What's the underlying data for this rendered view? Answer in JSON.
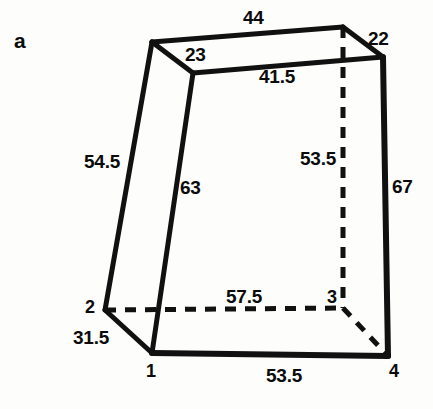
{
  "figure": {
    "panel_letter": "a",
    "description_type": "technical-line-drawing",
    "ink_color": "#111111",
    "background_color": "#fdfdfb",
    "vertex_labels": [
      {
        "id": "v1",
        "text": "1",
        "x": 146,
        "y": 362
      },
      {
        "id": "v2",
        "text": "2",
        "x": 85,
        "y": 298
      },
      {
        "id": "v3",
        "text": "3",
        "x": 327,
        "y": 288
      },
      {
        "id": "v4",
        "text": "4",
        "x": 389,
        "y": 362
      }
    ],
    "dimension_labels": [
      {
        "id": "top-back",
        "text": "44",
        "x": 243,
        "y": 8
      },
      {
        "id": "top-left-short",
        "text": "23",
        "x": 185,
        "y": 45
      },
      {
        "id": "top-right-short",
        "text": "22",
        "x": 368,
        "y": 29
      },
      {
        "id": "top-front",
        "text": "41.5",
        "x": 259,
        "y": 67
      },
      {
        "id": "left-back-edge",
        "text": "54.5",
        "x": 84,
        "y": 152
      },
      {
        "id": "left-front-edge",
        "text": "63",
        "x": 180,
        "y": 178
      },
      {
        "id": "back-right-edge",
        "text": "53.5",
        "x": 300,
        "y": 149
      },
      {
        "id": "right-edge",
        "text": "67",
        "x": 392,
        "y": 177
      },
      {
        "id": "bottom-back",
        "text": "57.5",
        "x": 226,
        "y": 287
      },
      {
        "id": "bottom-left",
        "text": "31.5",
        "x": 73,
        "y": 328
      },
      {
        "id": "bottom-front",
        "text": "53.5",
        "x": 266,
        "y": 366
      }
    ],
    "geometry": {
      "solid_edges": [
        {
          "name": "edge-top-back",
          "x1": 152,
          "y1": 42,
          "x2": 343,
          "y2": 27,
          "w": 5
        },
        {
          "name": "edge-top-left-short",
          "x1": 152,
          "y1": 42,
          "x2": 193,
          "y2": 73,
          "w": 5
        },
        {
          "name": "edge-top-front",
          "x1": 193,
          "y1": 73,
          "x2": 383,
          "y2": 57,
          "w": 5
        },
        {
          "name": "edge-top-right-short",
          "x1": 343,
          "y1": 27,
          "x2": 383,
          "y2": 57,
          "w": 5
        },
        {
          "name": "edge-left-back",
          "x1": 152,
          "y1": 42,
          "x2": 105,
          "y2": 310,
          "w": 5
        },
        {
          "name": "edge-left-front",
          "x1": 193,
          "y1": 73,
          "x2": 152,
          "y2": 353,
          "w": 5
        },
        {
          "name": "edge-right-front",
          "x1": 383,
          "y1": 57,
          "x2": 388,
          "y2": 356,
          "w": 6
        },
        {
          "name": "edge-bottom-left",
          "x1": 105,
          "y1": 310,
          "x2": 152,
          "y2": 353,
          "w": 5
        },
        {
          "name": "edge-bottom-front",
          "x1": 152,
          "y1": 353,
          "x2": 388,
          "y2": 356,
          "w": 6
        }
      ],
      "hidden_edges": [
        {
          "name": "hidden-bottom-back",
          "x1": 105,
          "y1": 310,
          "x2": 343,
          "y2": 308,
          "w": 5
        },
        {
          "name": "hidden-back-vertical",
          "x1": 343,
          "y1": 27,
          "x2": 343,
          "y2": 308,
          "w": 5
        },
        {
          "name": "hidden-bottom-right",
          "x1": 343,
          "y1": 308,
          "x2": 388,
          "y2": 356,
          "w": 5
        }
      ]
    }
  }
}
